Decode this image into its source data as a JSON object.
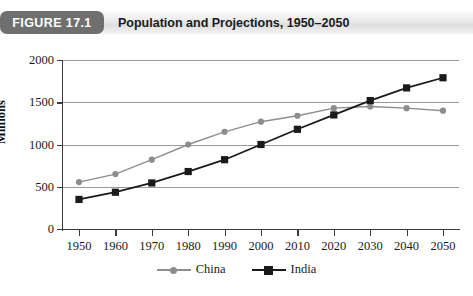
{
  "figure": {
    "badge": "FIGURE 17.1",
    "title": "Population and Projections, 1950–2050"
  },
  "chart_data": {
    "type": "line",
    "title": "Population and Projections, 1950–2050",
    "xlabel": "",
    "ylabel": "Millions",
    "categories": [
      "1950",
      "1960",
      "1970",
      "1980",
      "1990",
      "2000",
      "2010",
      "2020",
      "2030",
      "2040",
      "2050"
    ],
    "x": [
      1950,
      1960,
      1970,
      1980,
      1990,
      2000,
      2010,
      2020,
      2030,
      2040,
      2050
    ],
    "xlim": [
      1945,
      2055
    ],
    "ylim": [
      0,
      2000
    ],
    "yticks": [
      0,
      500,
      1000,
      1500,
      2000
    ],
    "ytick_labels": [
      "0",
      "500",
      "1000",
      "1500",
      "2000"
    ],
    "grid": "horizontal",
    "legend_position": "bottom",
    "series": [
      {
        "name": "China",
        "color": "#8d8d8d",
        "marker": "circle",
        "values": [
          555,
          650,
          820,
          1000,
          1150,
          1270,
          1340,
          1430,
          1450,
          1430,
          1400
        ]
      },
      {
        "name": "India",
        "color": "#1a1a1a",
        "marker": "square",
        "values": [
          350,
          435,
          545,
          680,
          820,
          1000,
          1180,
          1350,
          1520,
          1670,
          1790
        ]
      }
    ]
  },
  "colors": {
    "badge_background": "#6f6f6f",
    "header_background": "#e9e9e9",
    "axis": "#3b3b3b",
    "gridline": "#9a9a9a",
    "china": "#8d8d8d",
    "india": "#1a1a1a"
  }
}
